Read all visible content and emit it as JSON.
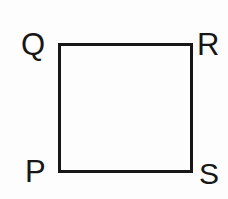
{
  "figure": {
    "background_color": "#fdfdfd",
    "stroke_color": "#171717",
    "label_color": "#171717",
    "stroke_width": 3
  },
  "shape": {
    "name": "square",
    "sides": 4,
    "left": 58,
    "top": 43,
    "right": 193,
    "bottom": 173,
    "width": 135,
    "height": 130
  },
  "labels": {
    "top_left": "Q",
    "top_right": "R",
    "bottom_left": "P",
    "bottom_right": "S"
  },
  "chart_data": {
    "type": "diagram",
    "shape": "square",
    "vertices": [
      {
        "label": "P",
        "x": 58,
        "y": 173,
        "position": "bottom-left",
        "label_offset": "outside-left"
      },
      {
        "label": "Q",
        "x": 58,
        "y": 43,
        "position": "top-left",
        "label_offset": "outside-left"
      },
      {
        "label": "R",
        "x": 193,
        "y": 43,
        "position": "top-right",
        "label_offset": "outside-right"
      },
      {
        "label": "S",
        "x": 193,
        "y": 173,
        "position": "bottom-right",
        "label_offset": "outside-right"
      }
    ],
    "edges": [
      {
        "from": "P",
        "to": "Q",
        "name": "left-edge"
      },
      {
        "from": "Q",
        "to": "R",
        "name": "top-edge"
      },
      {
        "from": "R",
        "to": "S",
        "name": "right-edge"
      },
      {
        "from": "S",
        "to": "P",
        "name": "bottom-edge"
      }
    ],
    "grid": false,
    "legend": null,
    "xlabel": "",
    "ylabel": ""
  }
}
